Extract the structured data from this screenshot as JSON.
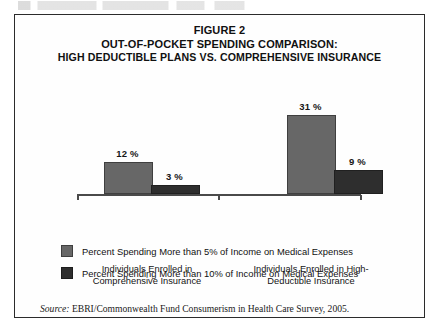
{
  "figure": {
    "title_line1": "FIGURE 2",
    "title_line2": "OUT-OF-POCKET SPENDING COMPARISON:",
    "title_line3": "HIGH DEDUCTIBLE PLANS VS. COMPREHENSIVE INSURANCE",
    "source_label": "Source:",
    "source_text": "EBRI/Commonwealth Fund Consumerism in Health Care Survey, 2005."
  },
  "chart_data": {
    "type": "bar",
    "title": "FIGURE 2 OUT-OF-POCKET SPENDING COMPARISON: HIGH DEDUCTIBLE PLANS VS. COMPREHENSIVE INSURANCE",
    "xlabel": "",
    "ylabel": "",
    "ylim": [
      0,
      35
    ],
    "grid": false,
    "legend_position": "bottom-left",
    "categories": [
      "Individuals Enrolled in Comprehensive Insurance",
      "Individuals Enrolled in High-Deductible Insurance"
    ],
    "category_lines": [
      [
        "Individuals Enrolled in",
        "Comprehensive Insurance"
      ],
      [
        "Individuals Enrolled in High-",
        "Deductible Insurance"
      ]
    ],
    "series": [
      {
        "name": "Percent Spending More than 5% of Income on Medical Expenses",
        "color": "#676767",
        "values": [
          12,
          31
        ],
        "labels": [
          "12 %",
          "31 %"
        ]
      },
      {
        "name": "Percent Spending More than 10% of Income on Medical Expenses",
        "color": "#2e2e2e",
        "values": [
          3,
          9
        ],
        "labels": [
          "3 %",
          "9 %"
        ]
      }
    ]
  }
}
